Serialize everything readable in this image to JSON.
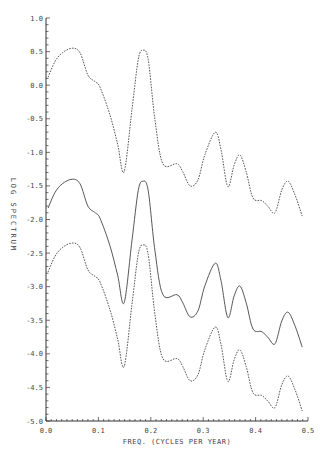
{
  "chart_data": {
    "type": "line",
    "title": "",
    "xlabel": "FREQ. (CYCLES PER YEAR)",
    "ylabel": "LOG SPECTRUM",
    "xlim": [
      0.0,
      0.5
    ],
    "ylim": [
      -5.0,
      1.0
    ],
    "x_ticks": [
      "0.0",
      "0.1",
      "0.2",
      "0.3",
      "0.4",
      "0.5"
    ],
    "y_ticks": [
      "1.0",
      "0.5",
      "0.0",
      "-0.5",
      "-1.0",
      "-1.5",
      "-2.0",
      "-2.5",
      "-3.0",
      "-3.5",
      "-4.0",
      "-4.5",
      "-5.0"
    ],
    "grid": false,
    "legend": null,
    "x": [
      0.004,
      0.017,
      0.031,
      0.05,
      0.065,
      0.08,
      0.094,
      0.103,
      0.122,
      0.137,
      0.149,
      0.164,
      0.176,
      0.185,
      0.195,
      0.208,
      0.223,
      0.25,
      0.261,
      0.275,
      0.29,
      0.303,
      0.323,
      0.334,
      0.347,
      0.359,
      0.37,
      0.382,
      0.395,
      0.412,
      0.424,
      0.437,
      0.45,
      0.462,
      0.475,
      0.489
    ],
    "series": [
      {
        "name": "upper (dashed)",
        "style": "dashed",
        "values": [
          0.12,
          0.35,
          0.48,
          0.55,
          0.48,
          0.15,
          0.05,
          -0.03,
          -0.44,
          -0.89,
          -1.29,
          -0.37,
          0.38,
          0.52,
          0.38,
          -0.52,
          -1.17,
          -1.17,
          -1.29,
          -1.5,
          -1.41,
          -1.04,
          -0.7,
          -0.96,
          -1.51,
          -1.19,
          -1.04,
          -1.29,
          -1.68,
          -1.72,
          -1.81,
          -1.9,
          -1.56,
          -1.43,
          -1.63,
          -1.95
        ]
      },
      {
        "name": "estimate (solid)",
        "style": "solid",
        "values": [
          -1.83,
          -1.6,
          -1.47,
          -1.4,
          -1.47,
          -1.8,
          -1.9,
          -1.98,
          -2.39,
          -2.84,
          -3.24,
          -2.32,
          -1.57,
          -1.43,
          -1.57,
          -2.47,
          -3.12,
          -3.12,
          -3.24,
          -3.45,
          -3.36,
          -2.99,
          -2.65,
          -2.91,
          -3.46,
          -3.14,
          -2.99,
          -3.24,
          -3.63,
          -3.67,
          -3.76,
          -3.85,
          -3.51,
          -3.38,
          -3.58,
          -3.9
        ]
      },
      {
        "name": "lower (dashed)",
        "style": "dashed",
        "values": [
          -2.78,
          -2.55,
          -2.42,
          -2.35,
          -2.42,
          -2.75,
          -2.85,
          -2.93,
          -3.34,
          -3.79,
          -4.19,
          -3.27,
          -2.52,
          -2.38,
          -2.52,
          -3.42,
          -4.07,
          -4.07,
          -4.19,
          -4.4,
          -4.31,
          -3.94,
          -3.6,
          -3.86,
          -4.41,
          -4.09,
          -3.94,
          -4.19,
          -4.58,
          -4.62,
          -4.71,
          -4.8,
          -4.46,
          -4.33,
          -4.53,
          -4.85
        ]
      }
    ]
  }
}
